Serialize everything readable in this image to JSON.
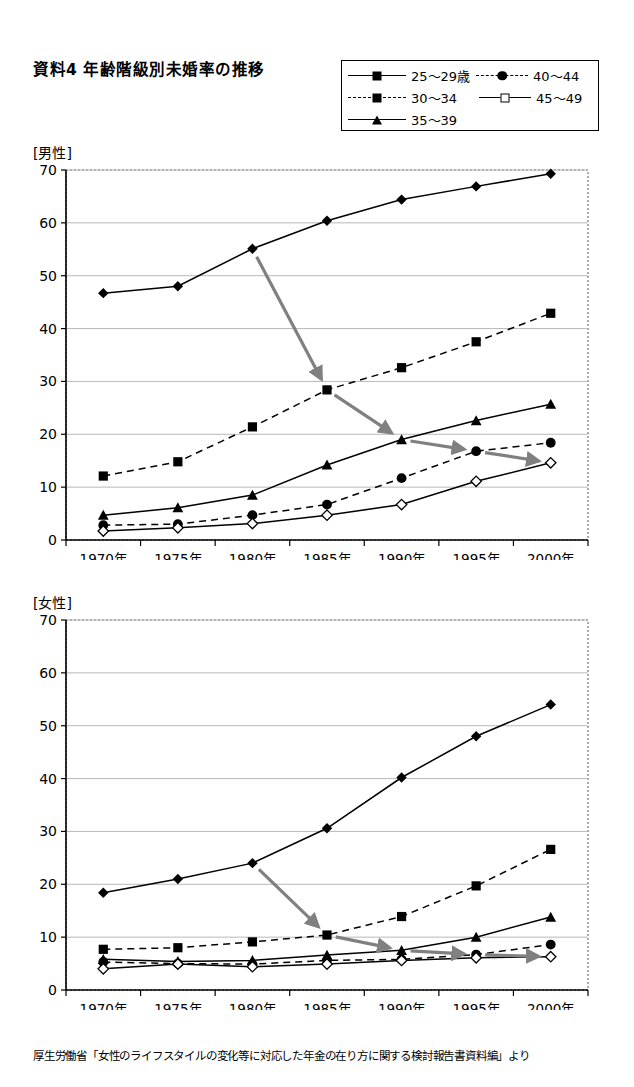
{
  "title": "資料4  年齢階級別未婚率の推移",
  "source_note": "厚生労働省「女性のライフスタイルの変化等に対応した年金の在り方に関する検討報告書資料編」より",
  "legend": {
    "items": [
      {
        "label": "25〜29歳",
        "marker": "filled-diamond",
        "line": "solid"
      },
      {
        "label": "40〜44",
        "marker": "filled-circle",
        "line": "dashed"
      },
      {
        "label": "30〜34",
        "marker": "filled-square",
        "line": "dashed"
      },
      {
        "label": "45〜49",
        "marker": "open-diamond",
        "line": "solid"
      },
      {
        "label": "35〜39",
        "marker": "filled-triangle",
        "line": "solid"
      }
    ]
  },
  "panels": [
    {
      "key": "male",
      "label": "[男性]"
    },
    {
      "key": "female",
      "label": "[女性]"
    }
  ],
  "chart_data": [
    {
      "type": "line",
      "title": "[男性]",
      "xlabel": "",
      "ylabel": "",
      "categories": [
        "1970年",
        "1975年",
        "1980年",
        "1985年",
        "1990年",
        "1995年",
        "2000年"
      ],
      "ylim": [
        0,
        70
      ],
      "yticks": [
        0,
        10,
        20,
        30,
        40,
        50,
        60,
        70
      ],
      "grid": true,
      "legend_position": "top-right",
      "series": [
        {
          "name": "25〜29歳",
          "marker": "filled-diamond",
          "line": "solid",
          "values": [
            46.7,
            48.0,
            55.1,
            60.4,
            64.4,
            66.9,
            69.3
          ]
        },
        {
          "name": "30〜34",
          "marker": "filled-square",
          "line": "dashed",
          "values": [
            12.1,
            14.8,
            21.4,
            28.4,
            32.6,
            37.5,
            42.9
          ]
        },
        {
          "name": "35〜39",
          "marker": "filled-triangle",
          "line": "solid",
          "values": [
            4.7,
            6.1,
            8.5,
            14.2,
            19.0,
            22.6,
            25.7
          ]
        },
        {
          "name": "40〜44",
          "marker": "filled-circle",
          "line": "dashed",
          "values": [
            2.8,
            3.0,
            4.7,
            6.7,
            11.7,
            16.8,
            18.4
          ]
        },
        {
          "name": "45〜49",
          "marker": "open-diamond",
          "line": "solid",
          "values": [
            1.7,
            2.3,
            3.1,
            4.7,
            6.7,
            11.1,
            14.6
          ]
        }
      ],
      "cohort_arrows": [
        {
          "from": {
            "x": "1980年",
            "y": 55.1
          },
          "to": {
            "x": "1985年",
            "y": 28.4
          }
        },
        {
          "from": {
            "x": "1985年",
            "y": 28.4
          },
          "to": {
            "x": "1990年",
            "y": 19.0
          }
        },
        {
          "from": {
            "x": "1990年",
            "y": 19.0
          },
          "to": {
            "x": "1995年",
            "y": 16.8
          }
        },
        {
          "from": {
            "x": "1995年",
            "y": 16.8
          },
          "to": {
            "x": "2000年",
            "y": 14.6
          }
        }
      ]
    },
    {
      "type": "line",
      "title": "[女性]",
      "xlabel": "",
      "ylabel": "",
      "categories": [
        "1970年",
        "1975年",
        "1980年",
        "1985年",
        "1990年",
        "1995年",
        "2000年"
      ],
      "ylim": [
        0,
        70
      ],
      "yticks": [
        0,
        10,
        20,
        30,
        40,
        50,
        60,
        70
      ],
      "grid": true,
      "legend_position": "top-right",
      "series": [
        {
          "name": "25〜29歳",
          "marker": "filled-diamond",
          "line": "solid",
          "values": [
            18.4,
            21.0,
            24.0,
            30.6,
            40.2,
            48.0,
            54.0
          ]
        },
        {
          "name": "30〜34",
          "marker": "filled-square",
          "line": "dashed",
          "values": [
            7.7,
            8.0,
            9.1,
            10.4,
            13.9,
            19.7,
            26.6
          ]
        },
        {
          "name": "35〜39",
          "marker": "filled-triangle",
          "line": "solid",
          "values": [
            5.8,
            5.4,
            5.6,
            6.6,
            7.5,
            10.0,
            13.8
          ]
        },
        {
          "name": "40〜44",
          "marker": "filled-circle",
          "line": "dashed",
          "values": [
            5.3,
            5.0,
            4.9,
            5.6,
            5.8,
            6.7,
            8.6
          ]
        },
        {
          "name": "45〜49",
          "marker": "open-diamond",
          "line": "solid",
          "values": [
            4.0,
            4.9,
            4.4,
            4.9,
            5.6,
            6.1,
            6.3
          ]
        }
      ],
      "cohort_arrows": [
        {
          "from": {
            "x": "1980年",
            "y": 24.0
          },
          "to": {
            "x": "1985年",
            "y": 10.4
          }
        },
        {
          "from": {
            "x": "1985年",
            "y": 10.4
          },
          "to": {
            "x": "1990年",
            "y": 7.5
          }
        },
        {
          "from": {
            "x": "1990年",
            "y": 7.5
          },
          "to": {
            "x": "1995年",
            "y": 6.7
          }
        },
        {
          "from": {
            "x": "1995年",
            "y": 6.7
          },
          "to": {
            "x": "2000年",
            "y": 6.3
          }
        }
      ]
    }
  ],
  "colors": {
    "ink": "#000000",
    "grid": "#b9b9b9",
    "arrow": "#808080"
  }
}
